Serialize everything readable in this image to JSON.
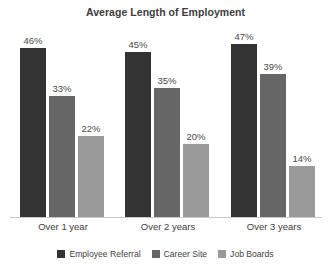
{
  "chart_data": {
    "type": "bar",
    "title": "Average Length of Employment",
    "xlabel": "",
    "ylabel": "",
    "categories": [
      "Over 1 year",
      "Over 2 years",
      "Over 3 years"
    ],
    "series": [
      {
        "name": "Employee Referral",
        "color": "#333333",
        "values": [
          46,
          45,
          47
        ],
        "labels": [
          "46%",
          "45%",
          "47%"
        ]
      },
      {
        "name": "Career Site",
        "color": "#666666",
        "values": [
          33,
          35,
          39
        ],
        "labels": [
          "33%",
          "35%",
          "39%"
        ]
      },
      {
        "name": "Job Boards",
        "color": "#9a9a9a",
        "values": [
          22,
          20,
          14
        ],
        "labels": [
          "22%",
          "20%",
          "14%"
        ]
      }
    ],
    "ylim": [
      0,
      52
    ],
    "grid": false,
    "legend_position": "bottom",
    "value_suffix": "%"
  },
  "legend": {
    "items": [
      {
        "label": "Employee Referral",
        "color": "#333333"
      },
      {
        "label": "Career Site",
        "color": "#666666"
      },
      {
        "label": "Job Boards",
        "color": "#9a9a9a"
      }
    ]
  }
}
